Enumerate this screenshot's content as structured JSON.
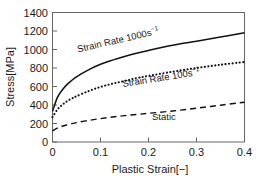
{
  "chart_data": {
    "type": "line",
    "title": "",
    "xlabel": "Plastic Strain[−]",
    "ylabel": "Stress[MPa]",
    "xlim": [
      0,
      0.4
    ],
    "ylim": [
      0,
      1400
    ],
    "xticks": [
      "0",
      "0.1",
      "0.2",
      "0.3",
      "0.4"
    ],
    "xtick_values": [
      0,
      0.1,
      0.2,
      0.3,
      0.4
    ],
    "yticks": [
      "0",
      "200",
      "400",
      "600",
      "800",
      "1000",
      "1200",
      "1400"
    ],
    "ytick_values": [
      0,
      200,
      400,
      600,
      800,
      1000,
      1200,
      1400
    ],
    "grid": false,
    "legend": "inline-annotations",
    "x": [
      0,
      0.01,
      0.02,
      0.03,
      0.04,
      0.05,
      0.075,
      0.1,
      0.125,
      0.15,
      0.175,
      0.2,
      0.25,
      0.3,
      0.35,
      0.4
    ],
    "series": [
      {
        "name": "Strain Rate 1000s⁻¹",
        "label_text": "Strain Rate 1000s",
        "label_sup": "−1",
        "style": "solid",
        "color": "#111111",
        "values": [
          330,
          480,
          560,
          620,
          665,
          705,
          780,
          840,
          885,
          925,
          960,
          990,
          1045,
          1090,
          1135,
          1180
        ]
      },
      {
        "name": "Strain Rate 100s⁻¹",
        "label_text": "Strain Rate 100s",
        "label_sup": "−1",
        "style": "dotted",
        "color": "#111111",
        "values": [
          270,
          350,
          400,
          440,
          470,
          495,
          550,
          595,
          630,
          660,
          690,
          715,
          760,
          800,
          835,
          865
        ]
      },
      {
        "name": "Static",
        "label_text": "Static",
        "label_sup": "",
        "style": "dashed",
        "color": "#111111",
        "values": [
          120,
          150,
          170,
          185,
          198,
          210,
          233,
          253,
          270,
          285,
          298,
          310,
          335,
          365,
          398,
          430
        ]
      }
    ],
    "annotations": [
      {
        "text": "Strain Rate 1000s",
        "sup": "−1",
        "x": 0.11,
        "y": 1030,
        "rotation": -13
      },
      {
        "text": "Strain Rate 100s",
        "sup": "−1",
        "x": 0.205,
        "y": 655,
        "rotation": -9
      },
      {
        "text": "Static",
        "sup": "",
        "x": 0.245,
        "y": 300,
        "rotation": 0
      }
    ]
  }
}
